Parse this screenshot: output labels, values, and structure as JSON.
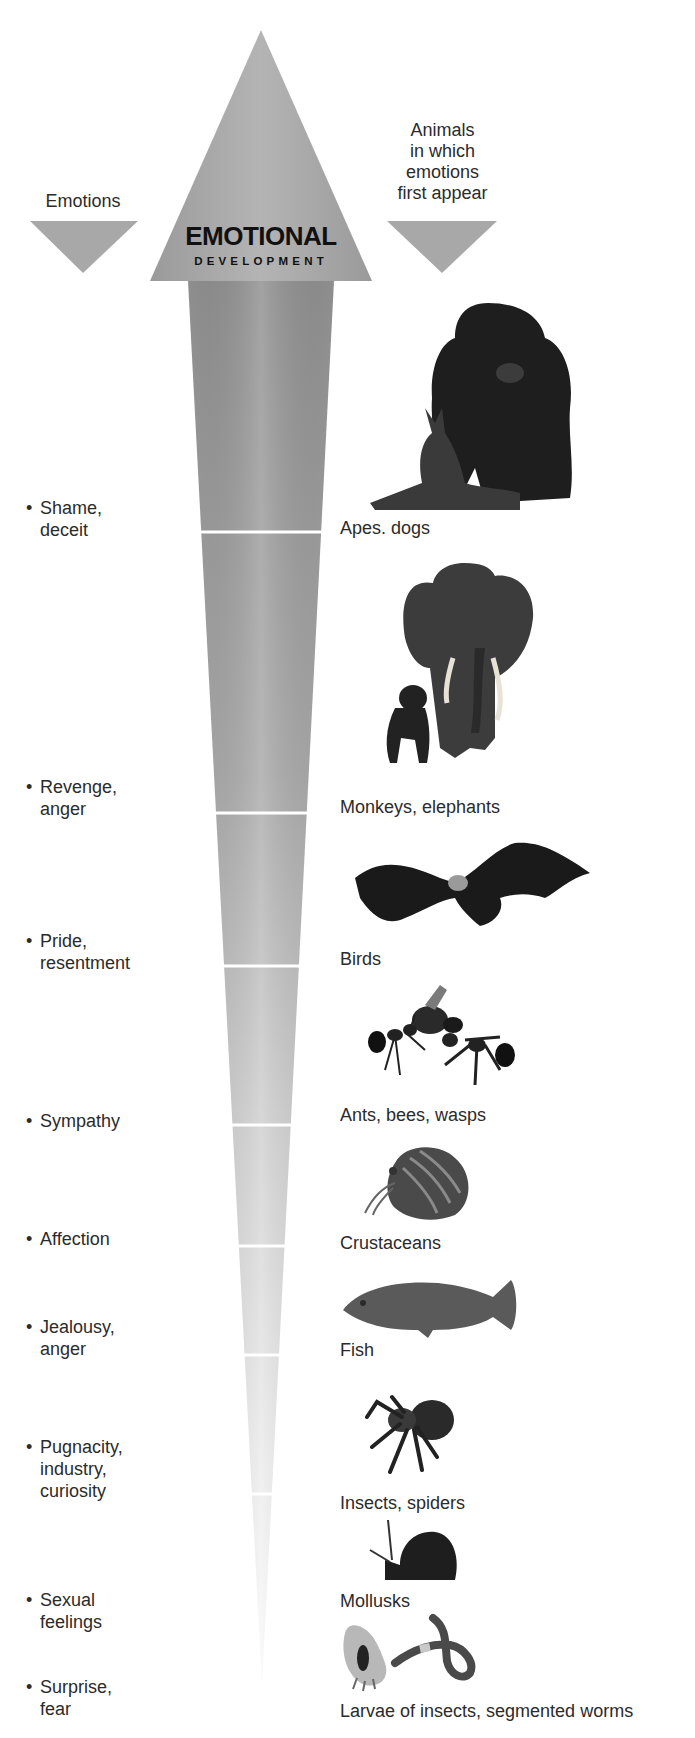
{
  "diagram": {
    "title": "EMOTIONAL",
    "subtitle": "DEVELOPMENT",
    "left_header": "Emotions",
    "right_header": "Animals\nin  which\nemotions\nfirst appear",
    "colors": {
      "arrow_dark": "#8c8c8c",
      "arrow_light": "#f2f2f2",
      "header_triangle": "#a6a6a6",
      "text": "#2b2b2b",
      "divider": "#ffffff"
    },
    "levels": [
      {
        "emotion": "Shame,\ndeceit",
        "animals": "Apes. dogs",
        "image": "gorilla-and-dog"
      },
      {
        "emotion": "Revenge,\nanger",
        "animals": "Monkeys, elephants",
        "image": "chimp-and-elephant"
      },
      {
        "emotion": "Pride,\nresentment",
        "animals": "Birds",
        "image": "eagle"
      },
      {
        "emotion": "Sympathy",
        "animals": "Ants, bees, wasps",
        "image": "ants-and-wasp"
      },
      {
        "emotion": "Affection",
        "animals": "Crustaceans",
        "image": "hermit-crab"
      },
      {
        "emotion": "Jealousy,\nanger",
        "animals": "Fish",
        "image": "fish"
      },
      {
        "emotion": "Pugnacity,\nindustry,\ncuriosity",
        "animals": "Insects, spiders",
        "image": "spider"
      },
      {
        "emotion": "Sexual\nfeelings",
        "animals": "Mollusks",
        "image": "snail"
      },
      {
        "emotion": "Surprise,\nfear",
        "animals": "Larvae of insects, segmented worms",
        "image": "larva-and-worm"
      }
    ],
    "bullet": "•"
  }
}
